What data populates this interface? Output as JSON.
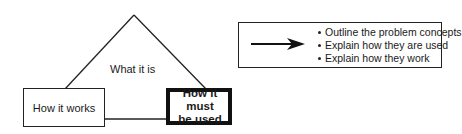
{
  "diagram": {
    "triangle": {
      "center_label": "What it is"
    },
    "boxes": {
      "left": "How it works",
      "right_line1": "How it must",
      "right_line2": "be used"
    },
    "legend": {
      "arrow_icon": "right-arrow",
      "items": [
        "Outline the problem concepts",
        "Explain how they are used",
        "Explain how they work"
      ]
    },
    "colors": {
      "line": "#222222",
      "background": "#ffffff"
    }
  }
}
